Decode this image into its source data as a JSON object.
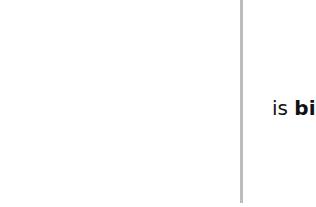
{
  "layout": {
    "divider_color": "#bdbdbd",
    "background_color": "#ffffff",
    "text_color": "#111111"
  },
  "right_pane": {
    "caption": {
      "prefix": "is ",
      "emphasis": "big"
    }
  }
}
